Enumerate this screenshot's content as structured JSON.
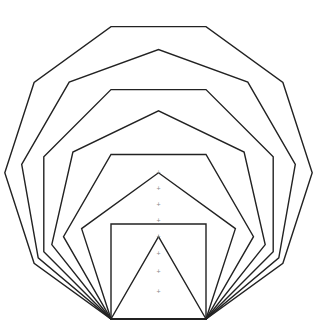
{
  "diagram": {
    "base": {
      "x1": 111,
      "x2": 206,
      "y": 319
    },
    "polygon_sides": [
      3,
      4,
      5,
      6,
      7,
      8,
      9,
      10
    ],
    "stroke_color": "#222222",
    "center_mark_color": "#888888",
    "background": "#ffffff"
  }
}
